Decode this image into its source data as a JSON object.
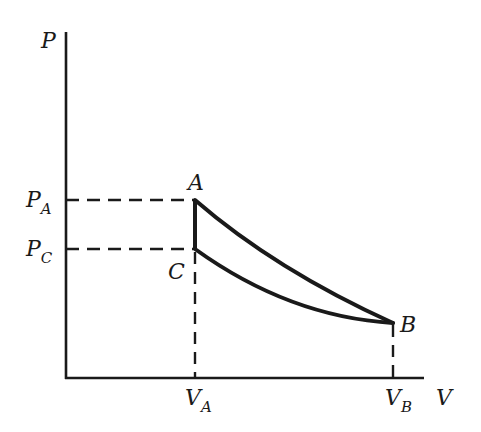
{
  "diagram": {
    "type": "PV diagram",
    "axes": {
      "y_label": "P",
      "x_label": "V"
    },
    "points": [
      {
        "name": "A",
        "label": "A"
      },
      {
        "name": "B",
        "label": "B"
      },
      {
        "name": "C",
        "label": "C"
      }
    ],
    "ticks": {
      "y": [
        {
          "main": "P",
          "sub": "A"
        },
        {
          "main": "P",
          "sub": "C"
        }
      ],
      "x": [
        {
          "main": "V",
          "sub": "A"
        },
        {
          "main": "V",
          "sub": "B"
        }
      ]
    },
    "curves": [
      {
        "name": "A-B upper curve"
      },
      {
        "name": "C-B lower curve"
      },
      {
        "name": "A-C vertical segment"
      }
    ],
    "colors": {
      "line": "#1a1a1a",
      "background": "#ffffff"
    }
  }
}
